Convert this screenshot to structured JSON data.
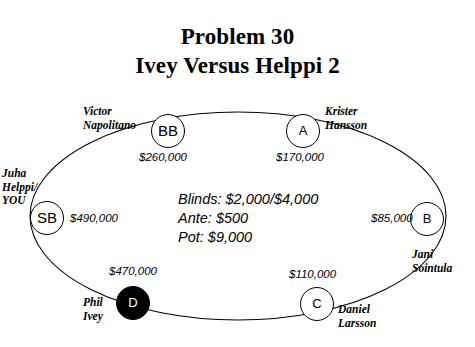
{
  "title": {
    "line1": "Problem 30",
    "line2": "Ivey Versus Helppi 2"
  },
  "table": {
    "center_info": {
      "blinds": "Blinds: $2,000/$4,000",
      "ante": "Ante: $500",
      "pot": "Pot: $9,000"
    },
    "seats": [
      {
        "position_label": "BB",
        "player_name": "Victor\nNapolitano",
        "stack": "$260,000",
        "is_dealer": false
      },
      {
        "position_label": "A",
        "player_name": "Krister\nHansson",
        "stack": "$170,000",
        "is_dealer": false
      },
      {
        "position_label": "B",
        "player_name": "Jani\nSointula",
        "stack": "$85,000",
        "is_dealer": false
      },
      {
        "position_label": "C",
        "player_name": "Daniel\nLarsson",
        "stack": "$110,000",
        "is_dealer": false
      },
      {
        "position_label": "D",
        "player_name": "Phil\nIvey",
        "stack": "$470,000",
        "is_dealer": true
      },
      {
        "position_label": "SB",
        "player_name": "Juha\nHelppi/\nYOU",
        "stack": "$490,000",
        "is_dealer": false
      }
    ]
  },
  "colors": {
    "background": "#ffffff",
    "ink": "#000000",
    "dealer_fill": "#000000",
    "dealer_text": "#ffffff"
  }
}
